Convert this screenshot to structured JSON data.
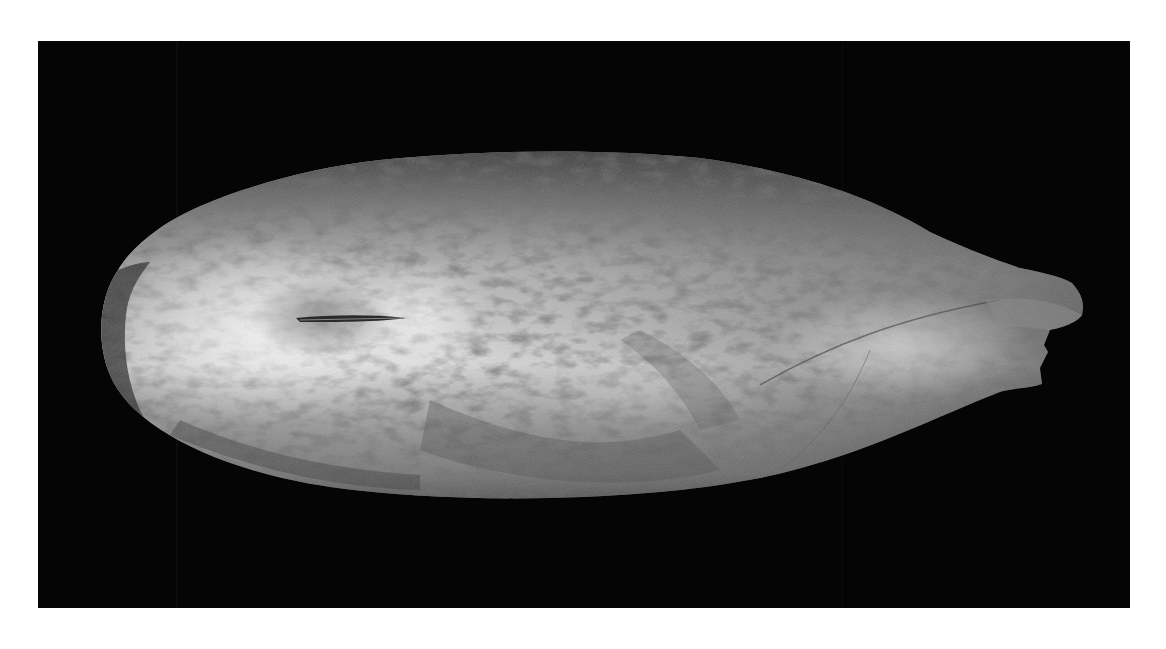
{
  "image": {
    "subject": "fossil shell specimen",
    "description": "Elongated, spindle-shaped fossil shell photographed on a black background, pale grey with mottled darker patches and a small slit-like groove near the rounded left end; the right end tapers into a broken, notched tip.",
    "background_color": "#050505",
    "page_color": "#ffffff",
    "shell_colors": {
      "highlight": "#f2f2f2",
      "midtone": "#a8a8a8",
      "shadow": "#555555",
      "mottle": "#3a3a3a"
    }
  }
}
